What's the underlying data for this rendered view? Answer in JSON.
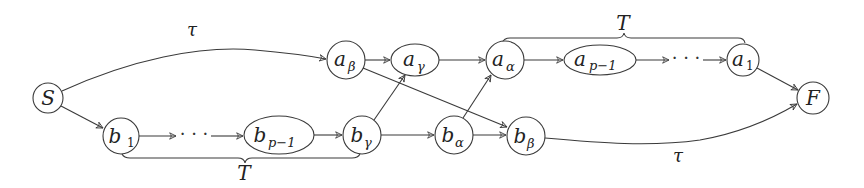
{
  "diagram": {
    "type": "directed-graph",
    "nodes": {
      "S": {
        "label": "S",
        "sub": ""
      },
      "b1": {
        "label": "b",
        "sub": "1"
      },
      "bp1": {
        "label": "b",
        "sub": "p−1"
      },
      "bgamma": {
        "label": "b",
        "sub": "γ"
      },
      "balpha": {
        "label": "b",
        "sub": "α"
      },
      "bbeta": {
        "label": "b",
        "sub": "β"
      },
      "abeta": {
        "label": "a",
        "sub": "β"
      },
      "agamma": {
        "label": "a",
        "sub": "γ"
      },
      "aalpha": {
        "label": "a",
        "sub": "α"
      },
      "ap1": {
        "label": "a",
        "sub": "p−1"
      },
      "a1": {
        "label": "a",
        "sub": "1"
      },
      "F": {
        "label": "F",
        "sub": ""
      }
    },
    "ellipsis": "· · ·",
    "edge_labels": {
      "top_tau": "τ",
      "bottom_tau": "τ",
      "top_brace": "T",
      "bottom_brace": "T"
    },
    "edges": [
      [
        "S",
        "abeta",
        "τ"
      ],
      [
        "S",
        "b1",
        ""
      ],
      [
        "b1",
        "dots-bottom",
        ""
      ],
      [
        "dots-bottom",
        "bp1",
        ""
      ],
      [
        "bp1",
        "bgamma",
        ""
      ],
      [
        "bgamma",
        "agamma",
        ""
      ],
      [
        "bgamma",
        "balpha",
        ""
      ],
      [
        "balpha",
        "aalpha",
        ""
      ],
      [
        "balpha",
        "bbeta",
        ""
      ],
      [
        "abeta",
        "agamma",
        ""
      ],
      [
        "abeta",
        "bbeta",
        ""
      ],
      [
        "agamma",
        "aalpha",
        ""
      ],
      [
        "aalpha",
        "ap1",
        ""
      ],
      [
        "ap1",
        "dots-top",
        ""
      ],
      [
        "dots-top",
        "a1",
        ""
      ],
      [
        "a1",
        "F",
        ""
      ],
      [
        "bbeta",
        "F",
        "τ"
      ]
    ],
    "braces": [
      {
        "from": "aalpha",
        "to": "a1",
        "position": "above",
        "label": "T"
      },
      {
        "from": "b1",
        "to": "bgamma",
        "position": "below",
        "label": "T"
      }
    ]
  }
}
